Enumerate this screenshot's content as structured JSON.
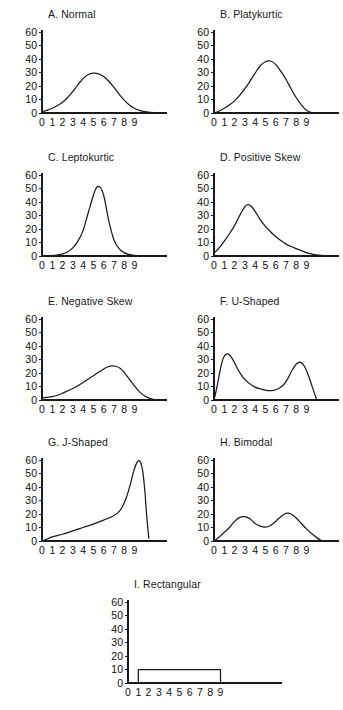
{
  "figure": {
    "background": "#ffffff",
    "line_color": "#1a1a1a",
    "columns": 2,
    "panel_count": 9
  },
  "axis": {
    "y_ticks": [
      "60",
      "50",
      "40",
      "30",
      "20",
      "10",
      "0"
    ],
    "x_ticks": [
      "0",
      "1",
      "2",
      "3",
      "4",
      "5",
      "6",
      "7",
      "8",
      "9"
    ],
    "ylim": [
      0,
      60
    ],
    "xlim": [
      0,
      11
    ]
  },
  "chart_data": [
    {
      "type": "line",
      "id": "a-normal",
      "title": "A. Normal",
      "xlabel": "",
      "ylabel": "",
      "xlim": [
        0,
        11
      ],
      "ylim": [
        0,
        60
      ],
      "grid": false,
      "legend": "none",
      "x": [
        0,
        0.5,
        1,
        1.5,
        2,
        2.5,
        3,
        3.5,
        4,
        4.5,
        5,
        5.5,
        6,
        6.5,
        7,
        7.5,
        8,
        8.5,
        9,
        9.5,
        10,
        10.5,
        11
      ],
      "values": [
        1,
        2,
        3.5,
        5.5,
        8,
        11.5,
        16,
        21,
        25.5,
        28.5,
        29.5,
        29,
        27,
        23.5,
        19,
        14,
        9.5,
        6,
        3.5,
        2,
        1,
        0.5,
        0.3
      ]
    },
    {
      "type": "line",
      "id": "b-platykurtic",
      "title": "B. Platykurtic",
      "xlabel": "",
      "ylabel": "",
      "xlim": [
        0,
        11
      ],
      "ylim": [
        0,
        60
      ],
      "grid": false,
      "legend": "none",
      "x": [
        0,
        0.5,
        1,
        1.5,
        2,
        2.5,
        3,
        3.5,
        4,
        4.5,
        5,
        5.5,
        6,
        6.5,
        7,
        7.5,
        8,
        8.5,
        9,
        9.5,
        10
      ],
      "values": [
        0,
        1.5,
        3.5,
        6,
        9,
        13,
        18,
        23.5,
        29.5,
        35,
        38,
        38.5,
        36,
        31,
        25,
        18,
        11.5,
        6,
        2,
        0.3,
        0
      ]
    },
    {
      "type": "line",
      "id": "c-leptokurtic",
      "title": "C. Leptokurtic",
      "xlabel": "",
      "ylabel": "",
      "xlim": [
        0,
        11
      ],
      "ylim": [
        0,
        60
      ],
      "grid": false,
      "legend": "none",
      "x": [
        0,
        1,
        1.5,
        2,
        2.5,
        3,
        3.5,
        4,
        4.5,
        5,
        5.25,
        5.5,
        5.75,
        6,
        6.25,
        6.5,
        7,
        7.5,
        8,
        8.5,
        9,
        10,
        11
      ],
      "values": [
        0,
        0.3,
        0.8,
        1.5,
        3,
        6,
        11,
        19,
        32,
        45,
        50,
        51.5,
        50,
        45,
        36,
        26,
        12,
        5.5,
        2.5,
        1,
        0.5,
        0.2,
        0
      ]
    },
    {
      "type": "line",
      "id": "d-positive-skew",
      "title": "D. Positive Skew",
      "xlabel": "",
      "ylabel": "",
      "xlim": [
        0,
        11
      ],
      "ylim": [
        0,
        60
      ],
      "grid": false,
      "legend": "none",
      "x": [
        0,
        0.5,
        1,
        1.5,
        2,
        2.5,
        3,
        3.3,
        3.6,
        4,
        4.5,
        5,
        5.5,
        6,
        6.5,
        7,
        7.5,
        8,
        8.5,
        9,
        9.5,
        10,
        11
      ],
      "values": [
        2,
        6,
        11,
        16.5,
        22.5,
        30,
        36.5,
        38,
        37,
        33,
        27,
        22,
        18,
        14.5,
        11.5,
        9,
        7,
        5.5,
        4,
        2.5,
        1.5,
        0.8,
        0
      ]
    },
    {
      "type": "line",
      "id": "e-negative-skew",
      "title": "E. Negative Skew",
      "xlabel": "",
      "ylabel": "",
      "xlim": [
        0,
        11
      ],
      "ylim": [
        0,
        60
      ],
      "grid": false,
      "legend": "none",
      "x": [
        0,
        0.5,
        1,
        1.5,
        2,
        3,
        4,
        5,
        5.5,
        6,
        6.5,
        6.8,
        7.2,
        7.6,
        8,
        8.5,
        9,
        9.5,
        10,
        10.5,
        11
      ],
      "values": [
        1.5,
        2,
        2.5,
        3.5,
        5,
        8.5,
        13,
        18,
        20.5,
        23,
        24.8,
        25.3,
        25,
        23.5,
        20.5,
        15.5,
        10.5,
        6,
        3,
        1.2,
        0
      ]
    },
    {
      "type": "line",
      "id": "f-u-shaped",
      "title": "F. U-Shaped",
      "xlabel": "",
      "ylabel": "",
      "xlim": [
        0,
        11
      ],
      "ylim": [
        0,
        60
      ],
      "grid": false,
      "legend": "none",
      "x": [
        0,
        0.3,
        0.6,
        0.9,
        1.2,
        1.5,
        1.9,
        2.3,
        2.8,
        3.4,
        4,
        4.6,
        5.2,
        5.8,
        6.3,
        6.8,
        7.2,
        7.6,
        8,
        8.4,
        8.8,
        9.2,
        9.6,
        10
      ],
      "values": [
        0,
        10,
        22,
        31,
        34,
        33.5,
        29,
        23,
        17,
        12.5,
        9.5,
        8,
        7,
        7.2,
        8.5,
        11.5,
        16,
        22,
        26.5,
        28,
        25,
        18,
        9,
        0
      ]
    },
    {
      "type": "line",
      "id": "g-j-shaped",
      "title": "G. J-Shaped",
      "xlabel": "",
      "ylabel": "",
      "xlim": [
        0,
        11
      ],
      "ylim": [
        0,
        60
      ],
      "grid": false,
      "legend": "none",
      "x": [
        0,
        0.5,
        1,
        2,
        3,
        4,
        5,
        6,
        6.8,
        7.4,
        7.8,
        8.2,
        8.6,
        8.9,
        9.2,
        9.4,
        9.6,
        9.8,
        10,
        10.2,
        10.4
      ],
      "values": [
        0,
        1.5,
        3,
        5,
        7.5,
        10,
        12.5,
        15.5,
        18,
        21,
        25,
        32,
        42,
        51,
        57.5,
        59.5,
        58,
        52,
        38,
        18,
        2
      ]
    },
    {
      "type": "line",
      "id": "h-bimodal",
      "title": "H. Bimodal",
      "xlabel": "",
      "ylabel": "",
      "xlim": [
        0,
        11
      ],
      "ylim": [
        0,
        60
      ],
      "grid": false,
      "legend": "none",
      "x": [
        0,
        0.5,
        1,
        1.5,
        2,
        2.5,
        3,
        3.5,
        4,
        4.5,
        5,
        5.5,
        6,
        6.5,
        7,
        7.5,
        8,
        8.5,
        9,
        9.5,
        10,
        10.5
      ],
      "values": [
        0,
        3,
        6.5,
        10,
        14.5,
        17.5,
        18,
        16.5,
        13,
        11,
        10.2,
        11.5,
        14.5,
        18,
        20.5,
        20,
        17,
        13,
        9,
        5.5,
        2.5,
        0
      ]
    },
    {
      "type": "bar",
      "id": "i-rectangular",
      "title": "I. Rectangular",
      "xlabel": "",
      "ylabel": "",
      "xlim": [
        0,
        11
      ],
      "ylim": [
        0,
        60
      ],
      "grid": false,
      "legend": "none",
      "rect_start": 1,
      "rect_end": 9,
      "rect_height": 10,
      "categories": [
        "1",
        "2",
        "3",
        "4",
        "5",
        "6",
        "7",
        "8",
        "9"
      ],
      "values": [
        10,
        10,
        10,
        10,
        10,
        10,
        10,
        10,
        10
      ]
    }
  ]
}
